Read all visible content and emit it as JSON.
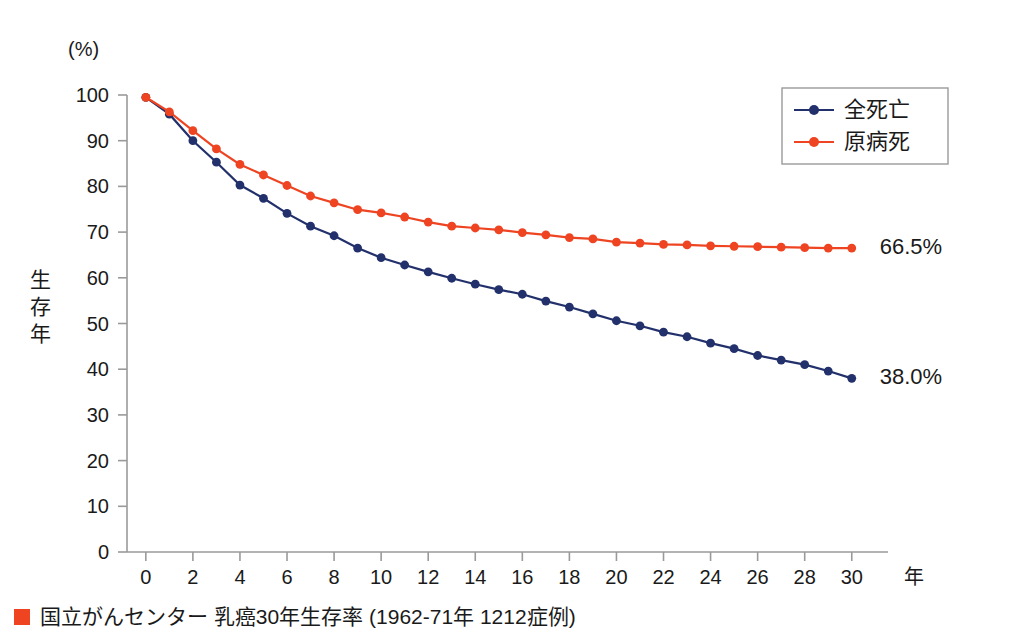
{
  "chart_data": {
    "type": "line",
    "title": "",
    "xlabel": "年",
    "ylabel": "生存年",
    "yunit": "(%)",
    "xlim": [
      -0.8,
      31.2
    ],
    "ylim": [
      0,
      100
    ],
    "grid": false,
    "legend_position": "top-right",
    "yticks": [
      0,
      10,
      20,
      30,
      40,
      50,
      60,
      70,
      80,
      90,
      100
    ],
    "xticks": [
      0,
      2,
      4,
      6,
      8,
      10,
      12,
      14,
      16,
      18,
      20,
      22,
      24,
      26,
      28,
      30
    ],
    "x": [
      0,
      1,
      2,
      3,
      4,
      5,
      6,
      7,
      8,
      9,
      10,
      11,
      12,
      13,
      14,
      15,
      16,
      17,
      18,
      19,
      20,
      21,
      22,
      23,
      24,
      25,
      26,
      27,
      28,
      29,
      30
    ],
    "series": [
      {
        "name": "全死亡",
        "color": "#22306b",
        "values": [
          99.5,
          95.8,
          90.0,
          85.3,
          80.3,
          77.4,
          74.1,
          71.3,
          69.2,
          66.5,
          64.4,
          62.8,
          61.3,
          59.9,
          58.6,
          57.4,
          56.4,
          54.9,
          53.6,
          52.1,
          50.6,
          49.5,
          48.1,
          47.1,
          45.7,
          44.5,
          43.0,
          42.0,
          41.0,
          39.6,
          38.0
        ],
        "end_label": "38.0%"
      },
      {
        "name": "原病死",
        "color": "#ee4422",
        "values": [
          99.5,
          96.3,
          92.2,
          88.2,
          84.8,
          82.5,
          80.2,
          77.9,
          76.4,
          74.9,
          74.2,
          73.3,
          72.2,
          71.3,
          70.9,
          70.5,
          69.9,
          69.4,
          68.8,
          68.5,
          67.8,
          67.6,
          67.3,
          67.2,
          67.0,
          66.9,
          66.8,
          66.7,
          66.6,
          66.5,
          66.5
        ],
        "end_label": "66.5%"
      }
    ],
    "annotations": [
      {
        "text": "66.5%",
        "series": "原病死"
      },
      {
        "text": "38.0%",
        "series": "全死亡"
      }
    ]
  },
  "legend": {
    "items": [
      {
        "label": "全死亡",
        "color": "#22306b"
      },
      {
        "label": "原病死",
        "color": "#ee4422"
      }
    ]
  },
  "caption": {
    "marker_color": "#ee4422",
    "text": "国立がんセンター 乳癌30年生存率 (1962-71年 1212症例)"
  }
}
